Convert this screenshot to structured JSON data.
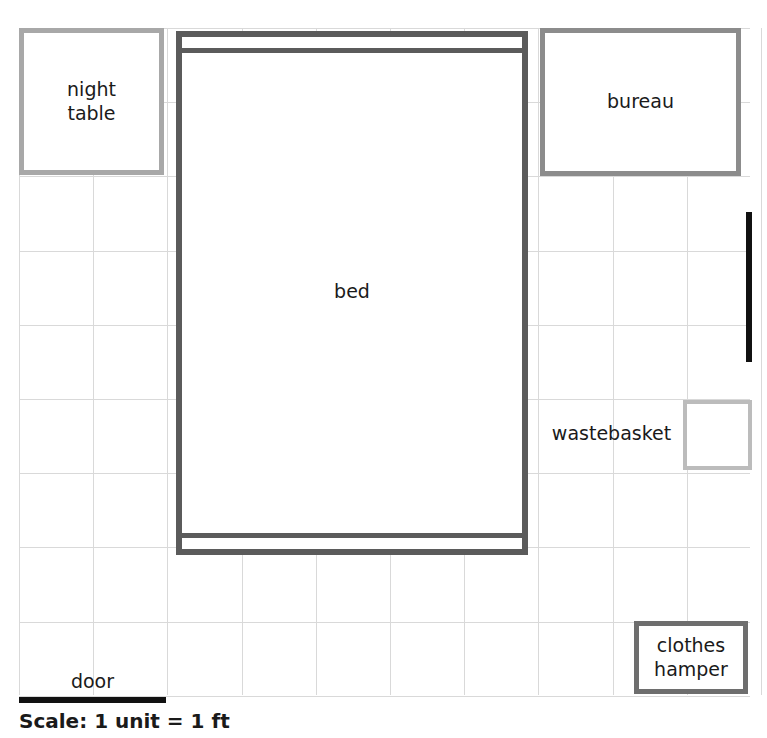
{
  "diagram": {
    "kind": "floor-plan",
    "scale_caption": "Scale: 1 unit = 1 ft",
    "grid": {
      "cell_px": 74.2,
      "columns": 10,
      "rows": 9,
      "origin_x_px": 19,
      "origin_y_px": 28,
      "line_color": "#d9d9d9"
    },
    "items": {
      "night_table": {
        "label_line1": "night",
        "label_line2": "table",
        "border_color": "#a8a8a8",
        "width_units": 2,
        "height_units": 2
      },
      "bureau": {
        "label": "bureau",
        "border_color": "#8c8c8c",
        "width_units": 3,
        "height_units": 2
      },
      "bed": {
        "label": "bed",
        "border_color": "#5b5b5b",
        "width_units": 5,
        "height_units": 7
      },
      "wastebasket": {
        "label": "wastebasket",
        "border_color": "#bcbcbc",
        "width_units": 1,
        "height_units": 1
      },
      "clothes_hamper": {
        "label_line1": "clothes",
        "label_line2": "hamper",
        "border_color": "#6e6e6e",
        "width_units": 1.5,
        "height_units": 1
      },
      "door_bottom": {
        "label": "door",
        "color": "#111111",
        "width_units": 2,
        "orientation": "horizontal"
      },
      "door_right": {
        "label": "door",
        "color": "#111111",
        "length_units": 2,
        "orientation": "vertical"
      }
    }
  }
}
